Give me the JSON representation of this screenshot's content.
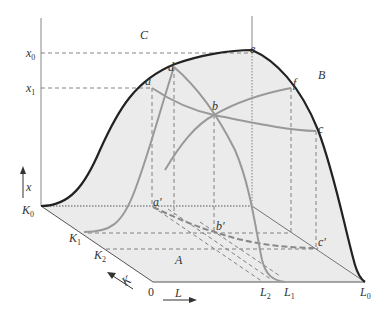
{
  "figure": {
    "type": "3D production surface diagram",
    "colors": {
      "surface_fill": "#ebebeb",
      "floor_fill": "#e6e6e6",
      "outline": "#222222",
      "isoquant_curves": "#999999",
      "dashed_guides": "#666666",
      "axis": "#888888",
      "text": "#333333"
    },
    "axis_labels": {
      "vertical_var": "x",
      "capital_var": "K",
      "labor_var": "L",
      "origin": "0"
    },
    "vertical_ticks": [
      {
        "main": "x",
        "sub": "0"
      },
      {
        "main": "x",
        "sub": "1"
      }
    ],
    "capital_ticks": [
      {
        "main": "K",
        "sub": "0"
      },
      {
        "main": "K",
        "sub": "1"
      },
      {
        "main": "K",
        "sub": "2"
      }
    ],
    "labor_ticks": [
      {
        "main": "L",
        "sub": "2"
      },
      {
        "main": "L",
        "sub": "1"
      },
      {
        "main": "L",
        "sub": "0"
      }
    ],
    "region_labels": {
      "A": "A",
      "B": "B",
      "C": "C"
    },
    "surface_points": {
      "a": "a",
      "b": "b",
      "c": "c",
      "d": "d",
      "e": "e",
      "f": "f"
    },
    "floor_points": {
      "a_prime": "a′",
      "b_prime": "b′",
      "c_prime": "c′"
    }
  }
}
